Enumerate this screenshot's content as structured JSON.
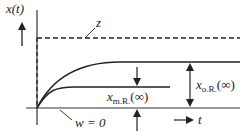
{
  "diagram": {
    "y_label": "x(t)",
    "x_label": "t",
    "dashed_label": "z",
    "baseline_label": "w = 0",
    "label_m": {
      "main": "x",
      "sub": "m.R.",
      "arg": "(∞)"
    },
    "label_o": {
      "main": "x",
      "sub": "o.R.",
      "arg": "(∞)"
    }
  }
}
